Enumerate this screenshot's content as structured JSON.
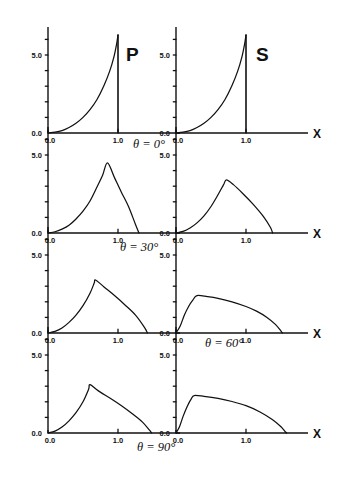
{
  "figure": {
    "panel_headings": [
      {
        "id": "p-heading",
        "text": "P"
      },
      {
        "id": "s-heading",
        "text": "S"
      }
    ],
    "row_labels": [
      {
        "id": "theta-0",
        "text": "θ = 0°"
      },
      {
        "id": "theta-30",
        "text": "θ = 30°"
      },
      {
        "id": "theta-60",
        "text": "θ = 60°"
      },
      {
        "id": "theta-90",
        "text": "θ = 90°"
      }
    ],
    "axis_text": {
      "x_axis_name": "X",
      "y_top_tick": "5.0",
      "origin": "0.0",
      "x_zero": "0.0",
      "x_one": "1.0"
    },
    "caption": ""
  },
  "chart_data": {
    "type": "line",
    "title": "",
    "xlabel": "X",
    "ylabel": "",
    "xlim": [
      0.0,
      1.9
    ],
    "ylim": [
      0.0,
      7.0
    ],
    "grid": false,
    "legend": "none",
    "xticks": [
      0.0,
      1.0
    ],
    "xticklabels": [
      "0.0",
      "1.0"
    ],
    "yticks": [
      0.0,
      1.0,
      2.0,
      3.0,
      4.0,
      5.0,
      6.0
    ],
    "yticklabels_shown": [
      "0.0",
      "5.0"
    ],
    "columns": [
      "P",
      "S"
    ],
    "rows": [
      "θ = 0°",
      "θ = 30°",
      "θ = 60°",
      "θ = 90°"
    ],
    "panels": [
      {
        "row": "θ = 0°",
        "column": "P",
        "peak_x": 1.0,
        "peak_y": 6.3,
        "shape": "convex rise to sharp peak at x=1.0 then vertical drop to zero",
        "x": [
          0.0,
          0.1,
          0.2,
          0.3,
          0.4,
          0.5,
          0.6,
          0.7,
          0.8,
          0.88,
          0.94,
          0.98,
          1.0,
          1.0
        ],
        "y": [
          0.0,
          0.05,
          0.15,
          0.35,
          0.62,
          1.0,
          1.5,
          2.15,
          3.05,
          3.95,
          4.85,
          5.7,
          6.3,
          0.0
        ]
      },
      {
        "row": "θ = 0°",
        "column": "S",
        "peak_x": 1.0,
        "peak_y": 6.3,
        "shape": "convex rise to sharp peak at x=1.0 then vertical drop to zero",
        "x": [
          0.0,
          0.1,
          0.2,
          0.3,
          0.4,
          0.5,
          0.6,
          0.7,
          0.8,
          0.88,
          0.94,
          0.98,
          1.0,
          1.0
        ],
        "y": [
          0.0,
          0.05,
          0.15,
          0.35,
          0.62,
          1.0,
          1.5,
          2.15,
          3.05,
          3.95,
          4.85,
          5.7,
          6.3,
          0.0
        ]
      },
      {
        "row": "θ = 30°",
        "column": "P",
        "peak_x": 0.85,
        "peak_y": 4.5,
        "zero_crossing_x": 1.3,
        "shape": "slow convex rise, peak near x=0.85, steep near-linear fall to zero at x=1.3",
        "x": [
          0.0,
          0.1,
          0.2,
          0.3,
          0.4,
          0.5,
          0.6,
          0.7,
          0.78,
          0.85,
          0.95,
          1.05,
          1.15,
          1.25,
          1.3
        ],
        "y": [
          0.0,
          0.08,
          0.25,
          0.5,
          0.9,
          1.4,
          2.05,
          2.95,
          3.7,
          4.5,
          3.55,
          2.6,
          1.7,
          0.55,
          0.0
        ]
      },
      {
        "row": "θ = 30°",
        "column": "S",
        "peak_x": 0.72,
        "peak_y": 3.4,
        "zero_crossing_x": 1.38,
        "shape": "broad convex rise, rounded peak near x=0.72, near-linear fall to zero at x=1.38",
        "x": [
          0.0,
          0.1,
          0.2,
          0.3,
          0.4,
          0.5,
          0.6,
          0.68,
          0.72,
          0.82,
          0.95,
          1.1,
          1.25,
          1.35,
          1.38
        ],
        "y": [
          0.0,
          0.1,
          0.32,
          0.65,
          1.1,
          1.7,
          2.45,
          3.1,
          3.4,
          3.1,
          2.55,
          1.85,
          1.05,
          0.35,
          0.0
        ]
      },
      {
        "row": "θ = 60°",
        "column": "P",
        "peak_x": 0.68,
        "peak_y": 3.4,
        "zero_crossing_x": 1.42,
        "shape": "convex rise, peak near x=0.68, gentle concave fall to zero at x=1.42",
        "x": [
          0.0,
          0.1,
          0.2,
          0.3,
          0.4,
          0.5,
          0.6,
          0.66,
          0.68,
          0.8,
          0.95,
          1.1,
          1.25,
          1.38,
          1.42
        ],
        "y": [
          0.0,
          0.1,
          0.32,
          0.68,
          1.15,
          1.75,
          2.55,
          3.2,
          3.4,
          2.95,
          2.4,
          1.8,
          1.15,
          0.35,
          0.0
        ]
      },
      {
        "row": "θ = 60°",
        "column": "S",
        "peak_x": 0.3,
        "peak_y": 2.4,
        "zero_crossing_x": 1.52,
        "shape": "steep early rise to shoulder near x=0.30, then long slow concave decline to zero at x=1.52",
        "x": [
          0.0,
          0.06,
          0.12,
          0.18,
          0.24,
          0.3,
          0.45,
          0.6,
          0.8,
          1.0,
          1.15,
          1.3,
          1.42,
          1.5,
          1.52
        ],
        "y": [
          0.0,
          0.45,
          1.15,
          1.7,
          2.1,
          2.4,
          2.33,
          2.22,
          2.0,
          1.7,
          1.4,
          1.0,
          0.55,
          0.12,
          0.0
        ]
      },
      {
        "row": "θ = 90°",
        "column": "P",
        "peak_x": 0.6,
        "peak_y": 3.1,
        "zero_crossing_x": 1.48,
        "shape": "convex rise, peak near x=0.60, near-linear decline to zero at x=1.48",
        "x": [
          0.0,
          0.1,
          0.2,
          0.3,
          0.4,
          0.5,
          0.58,
          0.6,
          0.72,
          0.9,
          1.05,
          1.2,
          1.35,
          1.45,
          1.48
        ],
        "y": [
          0.0,
          0.12,
          0.38,
          0.78,
          1.3,
          2.0,
          2.8,
          3.1,
          2.7,
          2.2,
          1.75,
          1.25,
          0.7,
          0.18,
          0.0
        ]
      },
      {
        "row": "θ = 90°",
        "column": "S",
        "peak_x": 0.26,
        "peak_y": 2.4,
        "zero_crossing_x": 1.58,
        "shape": "steep early rise to flat shoulder near x=0.26, then long gradual decline to zero at x=1.58",
        "x": [
          0.0,
          0.05,
          0.1,
          0.16,
          0.22,
          0.26,
          0.4,
          0.6,
          0.8,
          1.0,
          1.2,
          1.38,
          1.5,
          1.56,
          1.58
        ],
        "y": [
          0.0,
          0.4,
          1.05,
          1.7,
          2.2,
          2.4,
          2.35,
          2.22,
          2.02,
          1.75,
          1.35,
          0.85,
          0.4,
          0.08,
          0.0
        ]
      }
    ]
  }
}
